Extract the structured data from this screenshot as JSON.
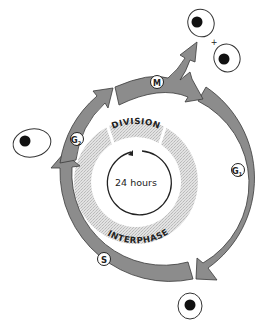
{
  "diagram": {
    "center_label": "24 hours",
    "ring_labels": {
      "top": "DIVISION",
      "bottom": "INTERPHASE"
    },
    "phases": [
      {
        "id": "G1",
        "label": "G",
        "subscript": "1"
      },
      {
        "id": "S",
        "label": "S",
        "subscript": ""
      },
      {
        "id": "G2",
        "label": "G",
        "subscript": "2"
      },
      {
        "id": "M",
        "label": "M",
        "subscript": ""
      }
    ],
    "plus_sign": "+",
    "colors": {
      "arrow_fill": "#8c8c8c",
      "arrow_stroke": "#3a3a3a",
      "stipple": "#d4d4d4",
      "cell_outline": "#333333",
      "nucleus": "#111111"
    }
  }
}
